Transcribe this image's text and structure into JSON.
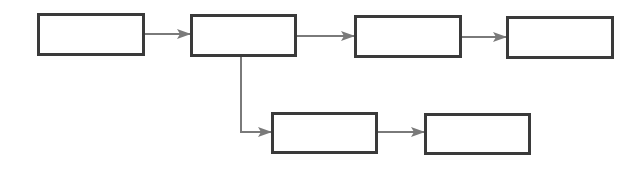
{
  "diagram": {
    "type": "flowchart",
    "colors": {
      "node_border": "#3a3a3a",
      "edge": "#7a7a7a",
      "background": "#ffffff"
    },
    "nodes": [
      {
        "id": "n1",
        "label": "",
        "x": 37,
        "y": 13,
        "w": 108,
        "h": 43
      },
      {
        "id": "n2",
        "label": "",
        "x": 190,
        "y": 14,
        "w": 107,
        "h": 43
      },
      {
        "id": "n3",
        "label": "",
        "x": 354,
        "y": 15,
        "w": 108,
        "h": 43
      },
      {
        "id": "n4",
        "label": "",
        "x": 506,
        "y": 16,
        "w": 108,
        "h": 43
      },
      {
        "id": "n5",
        "label": "",
        "x": 271,
        "y": 112,
        "w": 107,
        "h": 42
      },
      {
        "id": "n6",
        "label": "",
        "x": 424,
        "y": 113,
        "w": 107,
        "h": 42
      }
    ],
    "edges": [
      {
        "from": "n1",
        "to": "n2"
      },
      {
        "from": "n2",
        "to": "n3"
      },
      {
        "from": "n3",
        "to": "n4"
      },
      {
        "from": "n2",
        "to": "n5",
        "routing": "down-then-right"
      },
      {
        "from": "n5",
        "to": "n6"
      }
    ]
  }
}
